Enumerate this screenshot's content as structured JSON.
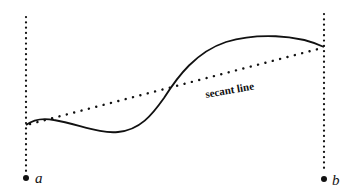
{
  "diagram": {
    "title": "",
    "labels": {
      "left_endpoint": "a",
      "right_endpoint": "b",
      "secant": "secant line"
    },
    "elements": {
      "curve": "smooth function graph from x=a to x=b",
      "secant_line": "dotted line connecting curve endpoints",
      "left_vertical": "dotted vertical line at x=a",
      "right_vertical": "dotted vertical line at x=b"
    },
    "colors": {
      "ink": "#111111",
      "background": "#ffffff"
    }
  }
}
